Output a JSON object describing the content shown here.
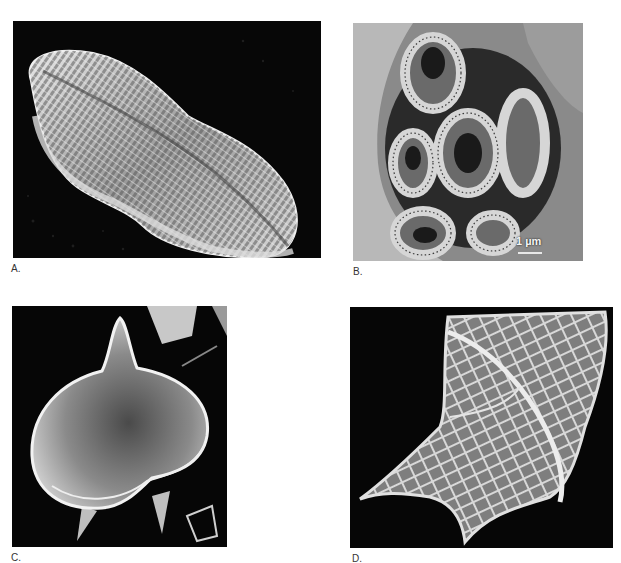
{
  "figure": {
    "panels": [
      {
        "id": "A",
        "label": "A.",
        "subject": "pennate diatom frustule (SEM)"
      },
      {
        "id": "B",
        "label": "B.",
        "subject": "coccolithophore coccosphere (SEM)",
        "scale_bar": "1 µm"
      },
      {
        "id": "C",
        "label": "C.",
        "subject": "dinoflagellate cyst with apical horn (SEM)"
      },
      {
        "id": "D",
        "label": "D.",
        "subject": "reticulate dinoflagellate theca (SEM)"
      }
    ]
  },
  "colors": {
    "background": "#ffffff",
    "micrograph_bg": "#050505",
    "specimen": "#c8c8c8",
    "label_text": "#333333"
  }
}
